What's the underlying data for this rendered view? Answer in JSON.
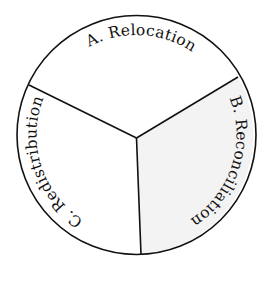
{
  "diagram": {
    "type": "circle-divided-three-sectors",
    "colors": {
      "stroke": "#111111",
      "background": "#ffffff",
      "highlight_fill": "#f3f3f3"
    },
    "sectors": [
      {
        "id": "A",
        "label": "A. Relocation",
        "highlighted": false
      },
      {
        "id": "B",
        "label": "B. Reconciliation",
        "highlighted": true
      },
      {
        "id": "C",
        "label": "C. Redistribution",
        "highlighted": false
      }
    ]
  }
}
